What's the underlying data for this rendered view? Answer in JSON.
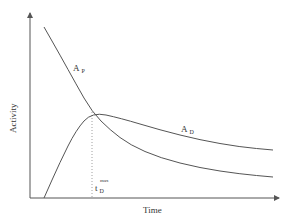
{
  "chart_data": {
    "type": "line",
    "title": "",
    "xlabel": "Time",
    "ylabel": "Activity",
    "grid": false,
    "legend": "none (inline curve labels)",
    "axis_ticks": "none",
    "series": [
      {
        "name": "A_P",
        "label_main": "A",
        "label_sub": "P",
        "description": "Parent activity: decreases from high value, crosses A_D at its maximum, then decays more steeply below A_D",
        "points_px": [
          [
            44,
            27
          ],
          [
            60,
            55
          ],
          [
            76,
            84
          ],
          [
            92,
            112
          ],
          [
            110,
            130
          ],
          [
            130,
            145
          ],
          [
            160,
            158
          ],
          [
            200,
            168
          ],
          [
            240,
            174
          ],
          [
            273,
            177
          ]
        ]
      },
      {
        "name": "A_D",
        "label_main": "A",
        "label_sub": "D",
        "description": "Daughter activity: rises from zero, reaches maximum at t_D^max where it equals A_P, then decays slowly",
        "points_px": [
          [
            44,
            198
          ],
          [
            60,
            162
          ],
          [
            76,
            130
          ],
          [
            92,
            112
          ],
          [
            120,
            118
          ],
          [
            160,
            130
          ],
          [
            200,
            140
          ],
          [
            240,
            147
          ],
          [
            273,
            150
          ]
        ]
      }
    ],
    "annotations": [
      {
        "type": "vertical-dotted-line",
        "x_label": "t_D^max",
        "description": "Time of maximum daughter activity"
      }
    ],
    "axes": {
      "origin_px": [
        30,
        198
      ],
      "x_end_px": 280,
      "y_end_px": 12
    }
  },
  "labels": {
    "ap_main": "A",
    "ap_sub": "P",
    "ad_main": "A",
    "ad_sub": "D",
    "tmax_main": "t",
    "tmax_sub": "D",
    "tmax_sup": "max",
    "xlabel": "Time",
    "ylabel": "Activity"
  }
}
